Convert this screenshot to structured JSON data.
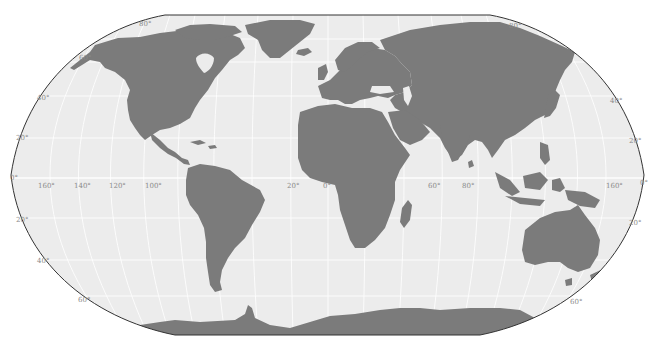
{
  "map": {
    "projection": "Robinson",
    "colors": {
      "ocean": "#ececec",
      "land": "#7b7b7b",
      "border": "#333333",
      "graticule": "#ffffff",
      "label": "#8a8a8a",
      "background": "#ffffff"
    },
    "latitude_labels_left": [
      "80°",
      "60°",
      "40°",
      "20°",
      "0°",
      "20°",
      "40°",
      "60°"
    ],
    "latitude_labels_right": [
      "80°",
      "40°",
      "20°",
      "0°",
      "20°",
      "60°"
    ],
    "longitude_labels": [
      "160°",
      "140°",
      "120°",
      "100°",
      "20°",
      "0°",
      "60°",
      "80°",
      "160°"
    ],
    "labels": {
      "lat_80_left": "80°",
      "lat_60_left": "60°",
      "lat_40_left": "40°",
      "lat_20_left": "20°",
      "lat_0_left": "0°",
      "lat_s20_left": "20°",
      "lat_s40_left": "40°",
      "lat_s60_left": "60°",
      "lat_80_right": "80°",
      "lat_40_right": "40°",
      "lat_20_right": "20°",
      "lat_0_right": "0°",
      "lat_s20_right": "20°",
      "lat_s60_right": "60°",
      "lon_160w": "160°",
      "lon_140w": "140°",
      "lon_120w": "120°",
      "lon_100w": "100°",
      "lon_20w": "20°",
      "lon_0": "0°",
      "lon_60e": "60°",
      "lon_80e": "80°",
      "lon_160e": "160°"
    }
  }
}
